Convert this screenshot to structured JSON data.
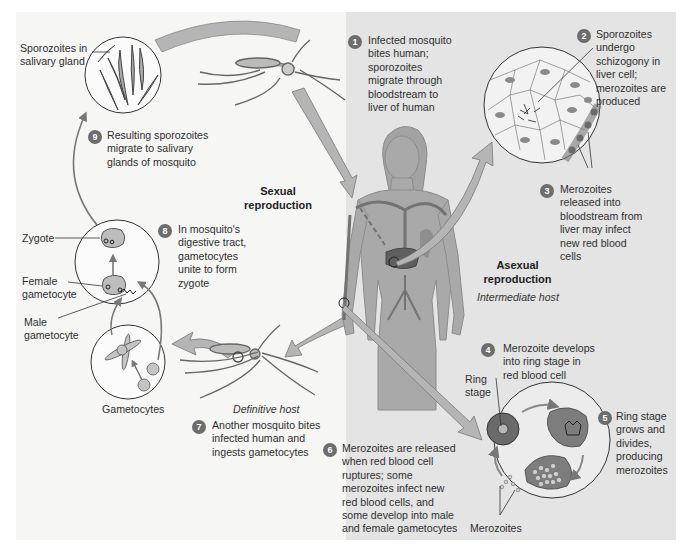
{
  "colors": {
    "left_panel_bg": "#f6f6f5",
    "right_panel_bg": "#e4e4e4",
    "badge": "#6d6d6d",
    "arrow_fill": "#b5b5b5",
    "body_fill": "#a9a9a9",
    "liver": "#5f5f5f"
  },
  "section_labels": {
    "sexual": "Sexual reproduction",
    "asexual": "Asexual reproduction",
    "definitive_host": "Definitive host",
    "intermediate_host": "Intermediate host"
  },
  "labels": {
    "sporozoites_in_gland": "Sporozoites in salivary gland",
    "zygote": "Zygote",
    "female_gametocyte": "Female gametocyte",
    "male_gametocyte": "Male gametocyte",
    "gametocytes": "Gametocytes",
    "ring_stage": "Ring stage",
    "merozoites": "Merozoites"
  },
  "steps": [
    {
      "n": "1",
      "text": "Infected mosquito bites human; sporozoites migrate through bloodstream to liver of human"
    },
    {
      "n": "2",
      "text": "Sporozoites undergo schizogony in liver cell; merozoites are produced"
    },
    {
      "n": "3",
      "text": "Merozoites released into bloodstream from liver may infect new red blood cells"
    },
    {
      "n": "4",
      "text": "Merozoite develops into ring stage in red blood cell"
    },
    {
      "n": "5",
      "text": "Ring stage grows and divides, producing merozoites"
    },
    {
      "n": "6",
      "text": "Merozoites are released when red blood cell ruptures; some merozoites infect new red blood cells, and some develop into male and female gametocytes"
    },
    {
      "n": "7",
      "text": "Another mosquito bites infected human and ingests gametocytes"
    },
    {
      "n": "8",
      "text": "In mosquito's digestive tract, gametocytes unite to form zygote"
    },
    {
      "n": "9",
      "text": "Resulting sporozoites migrate to salivary glands of mosquito"
    }
  ]
}
